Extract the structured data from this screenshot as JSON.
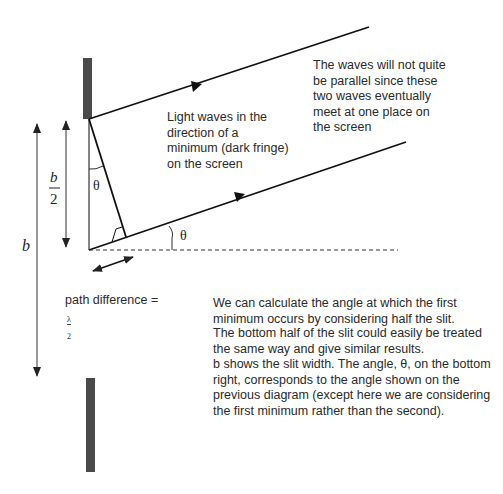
{
  "labels": {
    "b": "b",
    "b_half_numerator": "b",
    "b_half_denominator": "2",
    "theta_top": "θ",
    "theta_bottom": "θ",
    "path_difference": "path difference =",
    "lambda_numerator": "λ",
    "lambda_denominator": "2"
  },
  "annotations": {
    "light_waves": "Light waves in the\ndirection of a\nminimum (dark fringe)\non the screen",
    "not_parallel": "The waves will not quite\nbe parallel since these\ntwo waves eventually\nmeet at one place on\nthe screen"
  },
  "explanation": {
    "paragraph1": "We can calculate the angle at which the first\nminimum occurs by considering half the slit.",
    "paragraph2": "The bottom half of the slit could easily be treated\nthe same way and give similar results.",
    "paragraph3": "b shows the slit width.  The angle, θ, on the bottom\nright, corresponds to the angle shown on the\nprevious diagram (except here we are considering\nthe first minimum rather than the second)."
  },
  "colors": {
    "slit": "#4a4a4a",
    "line": "#111111",
    "dimension": "#333333"
  }
}
